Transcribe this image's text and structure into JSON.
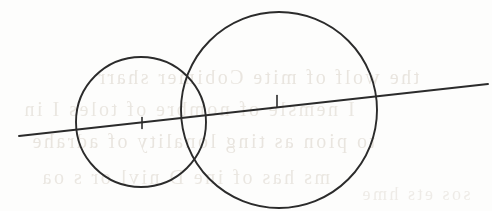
{
  "document": {
    "kind": "scanned-geometry-figure",
    "title": "Two intersecting circles with a common line through their centres",
    "page_background_color": "#fdfdfc",
    "ink_color": "#2b2b2b",
    "bleed_through_color": "#d9d2c8",
    "width": 492,
    "height": 211
  },
  "figure": {
    "caption": "Two intersecting circles whose centres both lie on a single straight line.",
    "elements": [
      {
        "name": "small-circle",
        "type": "circle",
        "cx": 141,
        "cy": 122,
        "r": 65,
        "stroke_width": 1.9
      },
      {
        "name": "large-circle",
        "type": "circle",
        "cx": 279,
        "cy": 110,
        "r": 98,
        "stroke_width": 1.9
      },
      {
        "name": "centre-line",
        "type": "line",
        "x1": 19,
        "y1": 136,
        "x2": 488,
        "y2": 84,
        "stroke_width": 1.9
      },
      {
        "name": "small-circle-centre-tick",
        "type": "tick",
        "x": 142,
        "y": 123,
        "length": 11,
        "stroke_width": 1.6
      },
      {
        "name": "large-circle-centre-tick",
        "type": "tick",
        "x": 277,
        "y": 101,
        "length": 11,
        "stroke_width": 1.6
      }
    ]
  },
  "bleed_through": {
    "note": "Faint illegible show-through text from the reverse side of the page",
    "lines": [
      {
        "text": "the wolf of mite Cobimer sharr",
        "x": 96,
        "y": 78,
        "size": 20,
        "opacity": 0.55
      },
      {
        "text": "I nemsle of nombre of toles I in",
        "x": 22,
        "y": 110,
        "size": 20,
        "opacity": 0.5
      },
      {
        "text": "to pion as ting lonality of adrahe",
        "x": 30,
        "y": 142,
        "size": 20,
        "opacity": 0.55
      },
      {
        "text": "ms  has of  ine D  nivl  or  s oa",
        "x": 40,
        "y": 178,
        "size": 20,
        "opacity": 0.5
      },
      {
        "text": "sos  ets  hme",
        "x": 360,
        "y": 196,
        "size": 18,
        "opacity": 0.4
      }
    ]
  }
}
